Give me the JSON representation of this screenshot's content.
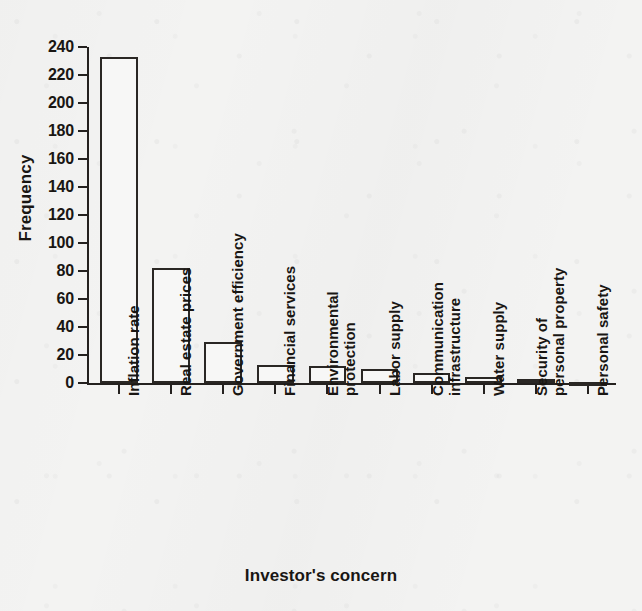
{
  "chart_data": {
    "type": "bar",
    "title": "",
    "xlabel": "Investor's concern",
    "ylabel": "Frequency",
    "categories": [
      "Inflation rate",
      "Real estate prices",
      "Government efficiency",
      "Financial services",
      "Environmental protection",
      "Labor supply",
      "Communication infrastructure",
      "Water supply",
      "Security of personal property",
      "Personal safety"
    ],
    "category_lines": [
      [
        "Inflation rate"
      ],
      [
        "Real estate prices"
      ],
      [
        "Government efficiency"
      ],
      [
        "Financial services"
      ],
      [
        "Environmental",
        "protection"
      ],
      [
        "Labor supply"
      ],
      [
        "Communication",
        "infrastructure"
      ],
      [
        "Water supply"
      ],
      [
        "Security of",
        "personal property"
      ],
      [
        "Personal safety"
      ]
    ],
    "values": [
      233,
      82,
      29,
      13,
      12,
      10,
      7,
      4,
      3,
      1
    ],
    "ylim": [
      0,
      240
    ],
    "ytick_values": [
      240,
      220,
      200,
      180,
      160,
      140,
      120,
      100,
      80,
      60,
      40,
      20,
      0
    ],
    "ytick_labels": [
      "240",
      "220",
      "200",
      "180",
      "160",
      "140",
      "120",
      "100",
      "80",
      "60",
      "40",
      "20",
      "0"
    ],
    "grid": false,
    "legend": false,
    "legend_position": "none",
    "bar_fill_color": "#f7f7f6",
    "bar_edge_color": "#2a2724",
    "axis_color": "#24211f",
    "background_color": "#f3f3f2"
  }
}
